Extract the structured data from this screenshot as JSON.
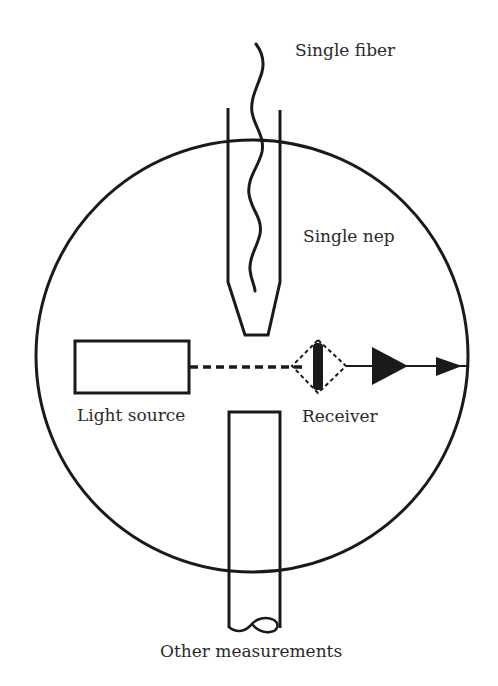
{
  "labels": {
    "single_fiber": "Single fiber",
    "single_nep": "Single nep",
    "light_source": "Light source",
    "receiver": "Receiver",
    "other_measurements": "Other measurements"
  },
  "colors": {
    "stroke": "#1a1a1a",
    "text": "#2a2a2a",
    "background": "#ffffff"
  }
}
